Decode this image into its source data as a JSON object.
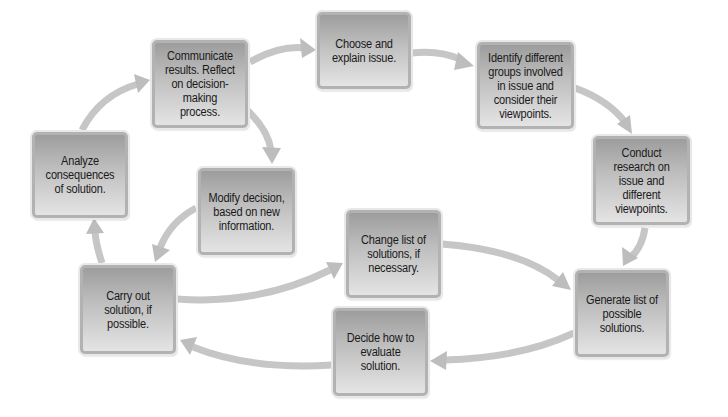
{
  "diagram": {
    "type": "cycle-flowchart",
    "colors": {
      "box_fill_top": "#9d9d9d",
      "box_fill_bottom": "#e4e4e4",
      "box_border": "#b2b2b2",
      "arrow": "#c4c4c4",
      "text": "#1a1a1a"
    },
    "nodes": [
      {
        "id": "choose",
        "label": "Choose and explain issue."
      },
      {
        "id": "identify",
        "label": "Identify different groups involved in issue and consider their viewpoints."
      },
      {
        "id": "research",
        "label": "Conduct research on issue and different viewpoints."
      },
      {
        "id": "generate",
        "label": "Generate list of possible solutions."
      },
      {
        "id": "decide",
        "label": "Decide how to evaluate solution."
      },
      {
        "id": "carry",
        "label": "Carry out solution, if possible."
      },
      {
        "id": "analyze",
        "label": "Analyze consequences of solution."
      },
      {
        "id": "communicate",
        "label": "Communicate results. Reflect on decision-making process."
      },
      {
        "id": "modify",
        "label": "Modify decision, based on new information."
      },
      {
        "id": "change",
        "label": "Change list of solutions, if necessary."
      }
    ],
    "edges": [
      {
        "from": "choose",
        "to": "identify"
      },
      {
        "from": "identify",
        "to": "research"
      },
      {
        "from": "research",
        "to": "generate"
      },
      {
        "from": "generate",
        "to": "decide"
      },
      {
        "from": "decide",
        "to": "carry"
      },
      {
        "from": "carry",
        "to": "analyze"
      },
      {
        "from": "analyze",
        "to": "communicate"
      },
      {
        "from": "communicate",
        "to": "choose"
      },
      {
        "from": "communicate",
        "to": "modify"
      },
      {
        "from": "modify",
        "to": "carry"
      },
      {
        "from": "carry",
        "to": "change"
      },
      {
        "from": "change",
        "to": "generate"
      }
    ]
  }
}
